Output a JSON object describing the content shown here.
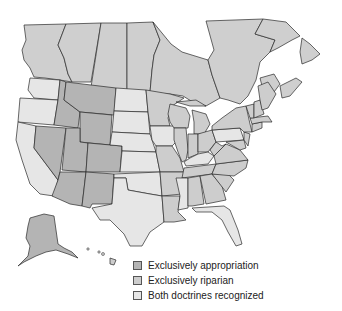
{
  "map": {
    "title": "Water rights doctrines by state",
    "colors": {
      "appropriation": "#b4b4b4",
      "riparian": "#cdcdcd",
      "both": "#e6e6e6",
      "canada": "#cfcfcf",
      "water": "#ffffff",
      "border": "#2a2a2a"
    },
    "regions": {
      "exclusively_appropriation": [
        "Montana",
        "Idaho",
        "Wyoming",
        "Nevada",
        "Utah",
        "Colorado",
        "Arizona",
        "New Mexico",
        "Alaska"
      ],
      "exclusively_riparian": [
        "Minnesota",
        "Wisconsin",
        "Michigan",
        "Illinois",
        "Indiana",
        "Ohio",
        "Missouri",
        "Arkansas",
        "Louisiana",
        "Tennessee",
        "Alabama",
        "Georgia",
        "South Carolina",
        "North Carolina",
        "Virginia",
        "West Virginia",
        "Maryland",
        "Delaware",
        "New Jersey",
        "New York",
        "Connecticut",
        "Rhode Island",
        "Massachusetts",
        "Vermont",
        "New Hampshire",
        "Maine",
        "Hawaii"
      ],
      "both_doctrines": [
        "Washington",
        "Oregon",
        "California",
        "North Dakota",
        "South Dakota",
        "Nebraska",
        "Kansas",
        "Oklahoma",
        "Texas",
        "Iowa",
        "Mississippi",
        "Kentucky",
        "Pennsylvania",
        "Florida"
      ]
    }
  },
  "legend": {
    "items": [
      {
        "label": "Exclusively appropriation",
        "color": "#b4b4b4"
      },
      {
        "label": "Exclusively riparian",
        "color": "#cdcdcd"
      },
      {
        "label": "Both doctrines recognized",
        "color": "#e6e6e6"
      }
    ]
  }
}
